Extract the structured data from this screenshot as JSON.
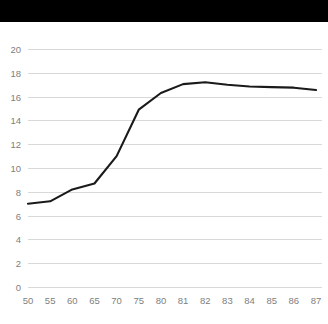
{
  "banner": {
    "present": true,
    "color": "#000000",
    "label": ""
  },
  "chart_data": {
    "type": "line",
    "title": "",
    "subtitle": "",
    "xlabel": "",
    "ylabel": "",
    "legend": [],
    "legend_position": "none",
    "grid": true,
    "grid_axis": "y",
    "background_color": "#ffffff",
    "line_color": "#1a1a1a",
    "gridline_color": "#d9d9d9",
    "tick_label_color": "#808080",
    "categories": [
      "50",
      "55",
      "60",
      "65",
      "70",
      "75",
      "80",
      "81",
      "82",
      "83",
      "84",
      "85",
      "86",
      "87"
    ],
    "x": [
      50,
      55,
      60,
      65,
      70,
      75,
      80,
      81,
      82,
      83,
      84,
      85,
      86,
      87
    ],
    "values": [
      7.0,
      7.2,
      8.2,
      8.7,
      11.0,
      14.9,
      16.3,
      17.05,
      17.2,
      17.0,
      16.85,
      16.8,
      16.75,
      16.55
    ],
    "series": [
      {
        "name": "",
        "values": [
          7.0,
          7.2,
          8.2,
          8.7,
          11.0,
          14.9,
          16.3,
          17.05,
          17.2,
          17.0,
          16.85,
          16.8,
          16.75,
          16.55
        ]
      }
    ],
    "ylim": [
      0,
      20
    ],
    "yticks": [
      0,
      2,
      4,
      6,
      8,
      10,
      12,
      14,
      16,
      18,
      20
    ],
    "ytick_labels": [
      "0",
      "2",
      "4",
      "6",
      "8",
      "10",
      "12",
      "14",
      "16",
      "18",
      "20"
    ],
    "xtick_labels": [
      "50",
      "55",
      "60",
      "65",
      "70",
      "75",
      "80",
      "81",
      "82",
      "83",
      "84",
      "85",
      "86",
      "87"
    ],
    "x_axis_scale": "categorical"
  }
}
